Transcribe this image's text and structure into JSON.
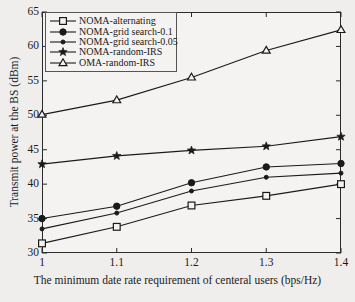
{
  "chart_data": {
    "type": "line",
    "title": "",
    "xlabel": "The minimum date rate requirement of centeral users (bps/Hz)",
    "ylabel": "Transmit power at the BS (dBm)",
    "x": [
      1,
      1.1,
      1.2,
      1.3,
      1.4
    ],
    "xtick_labels": [
      "1",
      "1.1",
      "1.2",
      "1.3",
      "1.4"
    ],
    "ytick_labels": [
      "30",
      "35",
      "40",
      "45",
      "50",
      "55",
      "60",
      "65"
    ],
    "xlim": [
      1,
      1.4
    ],
    "ylim": [
      30,
      65
    ],
    "grid": false,
    "legend_position": "upper-left",
    "series": [
      {
        "name": "NOMA-alternating",
        "marker": "open-square",
        "color": "#1a1a1a",
        "values": [
          31.4,
          33.8,
          36.9,
          38.3,
          40.0
        ]
      },
      {
        "name": "NOMA-grid search-0.1",
        "marker": "filled-circle-large",
        "color": "#1a1a1a",
        "values": [
          35.0,
          36.8,
          40.2,
          42.5,
          43.0
        ]
      },
      {
        "name": "NOMA-grid search-0.05",
        "marker": "filled-circle-small",
        "color": "#1a1a1a",
        "values": [
          33.5,
          35.8,
          39.0,
          41.0,
          41.6
        ]
      },
      {
        "name": "NOMA-random-IRS",
        "marker": "filled-star",
        "color": "#1a1a1a",
        "values": [
          42.9,
          44.1,
          44.9,
          45.5,
          46.9
        ]
      },
      {
        "name": "OMA-random-IRS",
        "marker": "open-triangle",
        "color": "#1a1a1a",
        "values": [
          50.1,
          52.2,
          55.5,
          59.4,
          62.4
        ]
      }
    ]
  }
}
